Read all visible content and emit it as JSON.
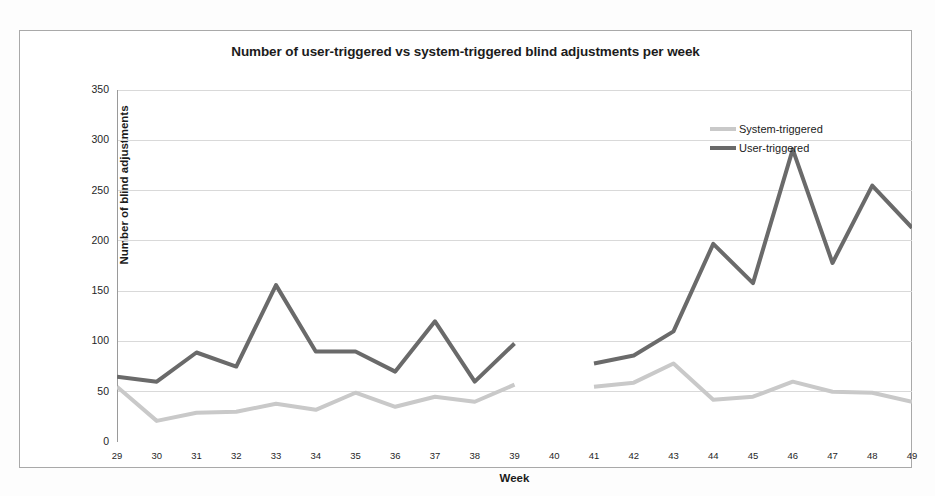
{
  "chart": {
    "title": "Number of user-triggered vs system-triggered blind adjustments per week",
    "xlabel": "Week",
    "ylabel": "Number of blind adjustments"
  },
  "legend": {
    "position": "top-right",
    "items": [
      {
        "label": "System-triggered",
        "color": "#c9c9c9",
        "marker": "line"
      },
      {
        "label": "User-triggered",
        "color": "#6a6a6a",
        "marker": "line"
      }
    ]
  },
  "chart_data": {
    "type": "line",
    "title": "Number of user-triggered vs system-triggered blind adjustments per week",
    "xlabel": "Week",
    "ylabel": "Number of blind adjustments",
    "x": [
      29,
      30,
      31,
      32,
      33,
      34,
      35,
      36,
      37,
      38,
      39,
      40,
      41,
      42,
      43,
      44,
      45,
      46,
      47,
      48,
      49
    ],
    "xtick_labels": [
      "29",
      "30",
      "31",
      "32",
      "33",
      "34",
      "35",
      "36",
      "37",
      "38",
      "39",
      "40",
      "41",
      "42",
      "43",
      "44",
      "45",
      "46",
      "47",
      "48",
      "49"
    ],
    "ytick_labels": [
      "0",
      "50",
      "100",
      "150",
      "200",
      "250",
      "300",
      "350"
    ],
    "yticks": [
      0,
      50,
      100,
      150,
      200,
      250,
      300,
      350
    ],
    "ylim": [
      0,
      350
    ],
    "xlim": [
      29,
      49
    ],
    "grid": true,
    "grid_axis": "y",
    "series": [
      {
        "name": "User-triggered",
        "color": "#6a6a6a",
        "line_width": 4,
        "values": [
          65,
          60,
          89,
          75,
          156,
          90,
          90,
          70,
          120,
          60,
          98,
          null,
          78,
          86,
          110,
          197,
          158,
          291,
          178,
          255,
          213
        ]
      },
      {
        "name": "System-triggered",
        "color": "#c9c9c9",
        "line_width": 4,
        "values": [
          55,
          21,
          29,
          30,
          38,
          32,
          49,
          35,
          45,
          40,
          57,
          null,
          55,
          59,
          78,
          42,
          45,
          60,
          50,
          49,
          40
        ]
      }
    ]
  }
}
